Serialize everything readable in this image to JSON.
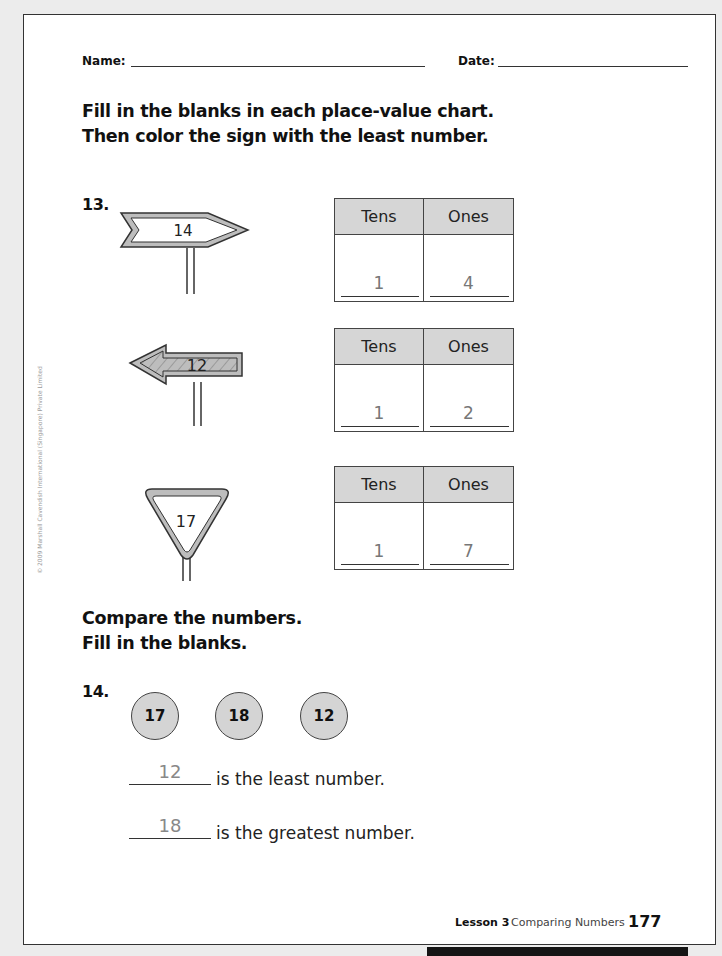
{
  "header": {
    "name_label": "Name:",
    "date_label": "Date:"
  },
  "section1": {
    "instruction_line1": "Fill in the blanks in each place-value chart.",
    "instruction_line2": "Then color the sign with the least number.",
    "question_number": "13.",
    "signs": [
      {
        "shape": "arrow-right",
        "number": "14",
        "colored": false
      },
      {
        "shape": "arrow-left",
        "number": "12",
        "colored": true
      },
      {
        "shape": "triangle",
        "number": "17",
        "colored": false
      }
    ],
    "charts": [
      {
        "tens_header": "Tens",
        "ones_header": "Ones",
        "tens_value": "1",
        "ones_value": "4"
      },
      {
        "tens_header": "Tens",
        "ones_header": "Ones",
        "tens_value": "1",
        "ones_value": "2"
      },
      {
        "tens_header": "Tens",
        "ones_header": "Ones",
        "tens_value": "1",
        "ones_value": "7"
      }
    ]
  },
  "copyright": "© 2009 Marshall Cavendish International (Singapore) Private Limited",
  "section2": {
    "instruction_line1": "Compare the numbers.",
    "instruction_line2": "Fill in the blanks.",
    "question_number": "14.",
    "circles": [
      "17",
      "18",
      "12"
    ],
    "answers": [
      {
        "value": "12",
        "text": "is the least number."
      },
      {
        "value": "18",
        "text": "is the greatest number."
      }
    ]
  },
  "footer": {
    "lesson": "Lesson 3",
    "title": "Comparing Numbers",
    "page_number": "177"
  },
  "colors": {
    "page_bg": "#ffffff",
    "outer_bg": "#ececec",
    "header_fill": "#d6d6d6",
    "answer_gray": "#888888"
  }
}
